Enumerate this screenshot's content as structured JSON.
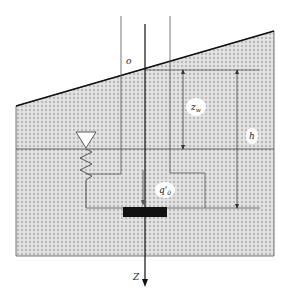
{
  "diagram": {
    "labels": {
      "origin": "o",
      "depth": "z",
      "depth_sub": "w",
      "height": "h",
      "flux": "q'",
      "flux_sub": "0",
      "axis": "Z"
    },
    "colors": {
      "soil_fill": "#d9d9d9",
      "line": "#333333",
      "source_block": "#111111"
    }
  }
}
